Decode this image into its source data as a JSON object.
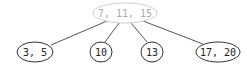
{
  "diagram": {
    "type": "b-tree",
    "root": {
      "label": "7, 11, 15",
      "cx": 125,
      "cy": 13,
      "rx": 32,
      "ry": 10,
      "stroke": "#cccccc",
      "text_color": "#aaaaaa"
    },
    "children": [
      {
        "label": "3, 5",
        "cx": 35,
        "cy": 52,
        "rx": 18,
        "ry": 10
      },
      {
        "label": "10",
        "cx": 101,
        "cy": 52,
        "rx": 11,
        "ry": 10
      },
      {
        "label": "13",
        "cx": 152,
        "cy": 52,
        "rx": 11,
        "ry": 10
      },
      {
        "label": "17, 20",
        "cx": 218,
        "cy": 52,
        "rx": 22,
        "ry": 10
      }
    ],
    "edges": [
      {
        "x1": 107,
        "y1": 21,
        "x2": 51,
        "y2": 45
      },
      {
        "x1": 119,
        "y1": 23,
        "x2": 105,
        "y2": 42
      },
      {
        "x1": 131,
        "y1": 23,
        "x2": 147,
        "y2": 42
      },
      {
        "x1": 143,
        "y1": 21,
        "x2": 203,
        "y2": 44
      }
    ],
    "child_stroke": "#333333",
    "child_text_color": "#222222",
    "edge_color": "#555555"
  }
}
